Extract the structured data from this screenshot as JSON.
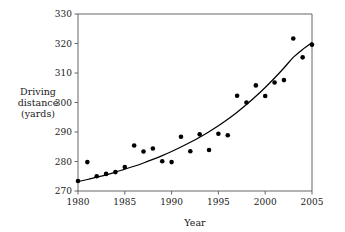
{
  "chart_data": {
    "type": "scatter",
    "title": "",
    "xlabel": "Year",
    "ylabel": "Driving distance (yards)",
    "ylabel_lines": [
      "Driving",
      "distance",
      "(yards)"
    ],
    "xlim": [
      1980,
      2005
    ],
    "ylim": [
      270,
      330
    ],
    "xticks": [
      1980,
      1985,
      1990,
      1995,
      2000,
      2005
    ],
    "xtick_labels": [
      "1980",
      "1985",
      "1990",
      "1995",
      "2000",
      "2005"
    ],
    "yticks": [
      270,
      280,
      290,
      300,
      310,
      320,
      330
    ],
    "ytick_labels": [
      "270",
      "280",
      "290",
      "300",
      "310",
      "320",
      "330"
    ],
    "grid": false,
    "legend": false,
    "marker_color": "#000000",
    "curve_color": "#000000",
    "axis_color": "#555555",
    "x": [
      1980,
      1981,
      1982,
      1983,
      1984,
      1985,
      1986,
      1987,
      1988,
      1989,
      1990,
      1991,
      1992,
      1993,
      1994,
      1995,
      1996,
      1997,
      1998,
      1999,
      2000,
      2001,
      2002,
      2003,
      2004,
      2005
    ],
    "y": [
      273.4,
      279.8,
      275.0,
      275.8,
      276.4,
      278.1,
      285.4,
      283.4,
      284.4,
      280.1,
      279.8,
      288.4,
      283.5,
      289.2,
      283.9,
      289.4,
      288.9,
      302.3,
      300.0,
      305.8,
      302.2,
      306.8,
      307.6,
      321.7,
      315.3,
      319.6
    ],
    "points": [
      {
        "year": 1980,
        "distance": 273.4
      },
      {
        "year": 1981,
        "distance": 279.8
      },
      {
        "year": 1982,
        "distance": 275.0
      },
      {
        "year": 1983,
        "distance": 275.8
      },
      {
        "year": 1984,
        "distance": 276.4
      },
      {
        "year": 1985,
        "distance": 278.1
      },
      {
        "year": 1986,
        "distance": 285.4
      },
      {
        "year": 1987,
        "distance": 283.4
      },
      {
        "year": 1988,
        "distance": 284.4
      },
      {
        "year": 1989,
        "distance": 280.1
      },
      {
        "year": 1990,
        "distance": 279.8
      },
      {
        "year": 1991,
        "distance": 288.4
      },
      {
        "year": 1992,
        "distance": 283.5
      },
      {
        "year": 1993,
        "distance": 289.2
      },
      {
        "year": 1994,
        "distance": 283.9
      },
      {
        "year": 1995,
        "distance": 289.4
      },
      {
        "year": 1996,
        "distance": 288.9
      },
      {
        "year": 1997,
        "distance": 302.3
      },
      {
        "year": 1998,
        "distance": 300.0
      },
      {
        "year": 1999,
        "distance": 305.8
      },
      {
        "year": 2000,
        "distance": 302.2
      },
      {
        "year": 2001,
        "distance": 306.8
      },
      {
        "year": 2002,
        "distance": 307.6
      },
      {
        "year": 2003,
        "distance": 321.7
      },
      {
        "year": 2004,
        "distance": 315.3
      },
      {
        "year": 2005,
        "distance": 319.6
      }
    ],
    "fit_curve": {
      "name": "fitted trend",
      "x": [
        1980,
        1981,
        1982,
        1983,
        1984,
        1985,
        1986,
        1987,
        1988,
        1989,
        1990,
        1991,
        1992,
        1993,
        1994,
        1995,
        1996,
        1997,
        1998,
        1999,
        2000,
        2001,
        2002,
        2003,
        2004,
        2005
      ],
      "y": [
        273.2,
        273.9,
        274.7,
        275.5,
        276.4,
        277.4,
        278.4,
        279.5,
        280.7,
        282.0,
        283.4,
        284.9,
        286.5,
        288.2,
        290.1,
        292.1,
        294.3,
        296.7,
        299.3,
        302.1,
        305.1,
        308.3,
        311.7,
        315.3,
        318.0,
        320.3
      ]
    }
  }
}
